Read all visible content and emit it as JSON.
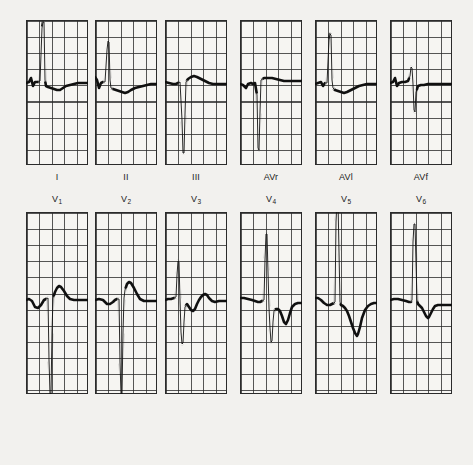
{
  "sheet": {
    "title": "12-lead electrocardiogram",
    "background_color": "#f2f1ee",
    "grid_color": "#2b2b2b",
    "trace_color": "#111111",
    "paper_speed": "25 mm/s",
    "calibration": "10 mm/mV"
  },
  "rows": [
    {
      "name": "limb-leads",
      "label_position": "below",
      "leads": [
        {
          "id": "I",
          "label": "I",
          "label_sub": ""
        },
        {
          "id": "II",
          "label": "II",
          "label_sub": ""
        },
        {
          "id": "III",
          "label": "III",
          "label_sub": ""
        },
        {
          "id": "AVR",
          "label": "AVr",
          "label_sub": ""
        },
        {
          "id": "AVL",
          "label": "AVl",
          "label_sub": ""
        },
        {
          "id": "AVF",
          "label": "AVf",
          "label_sub": ""
        }
      ]
    },
    {
      "name": "chest-leads",
      "label_position": "above",
      "leads": [
        {
          "id": "V1",
          "label": "V",
          "label_sub": "1"
        },
        {
          "id": "V2",
          "label": "V",
          "label_sub": "2"
        },
        {
          "id": "V3",
          "label": "V",
          "label_sub": "3"
        },
        {
          "id": "V4",
          "label": "V",
          "label_sub": "4"
        },
        {
          "id": "V5",
          "label": "V",
          "label_sub": "5"
        },
        {
          "id": "V6",
          "label": "V",
          "label_sub": "6"
        }
      ]
    }
  ],
  "chart_data": {
    "type": "line",
    "xlabel": "time",
    "ylabel": "voltage",
    "grid": true,
    "legend": "none",
    "panel_grid_columns": 5,
    "panel_grid_rows_limb": 9,
    "panel_grid_rows_chest": 11,
    "baseline_fraction_limb": 0.5,
    "baseline_fraction_chest": 0.5,
    "series": [
      {
        "name": "I",
        "baseline_y": 63,
        "points": "0,63 3,62 5,58 7,66 9,62 12,62 14,61 16,8 17,2 18,2 19,60 20,66 22,67 25,68 28,69 31,70 34,70 37,68 40,66 44,65 48,64 52,63 56,63 60,63 62,63"
      },
      {
        "name": "II",
        "baseline_y": 63,
        "points": "0,57 2,60 4,68 6,63 8,62 10,62 12,30 13,21 14,22 15,60 16,68 18,69 21,70 24,71 27,72 30,73 33,72 36,70 40,68 44,67 48,66 52,65 56,64 60,64 62,64"
      },
      {
        "name": "III",
        "baseline_y": 62,
        "points": "0,62 4,63 8,64 11,64 13,63 15,62 17,100 18,133 19,133 20,94 21,62 23,59 26,57 29,56 32,57 36,59 40,61 44,63 48,64 52,64 56,64 60,64 62,64"
      },
      {
        "name": "AVR",
        "baseline_y": 64,
        "points": "0,64 3,65 6,68 8,64 11,63 13,64 15,63 17,75 18,128 19,130 20,92 21,60 24,58 28,58 32,58 36,59 40,60 44,61 48,61 52,61 56,61 60,61 62,61"
      },
      {
        "name": "AVL",
        "baseline_y": 64,
        "points": "0,64 3,63 6,62 8,66 10,63 12,63 14,20 15,14 16,15 17,60 18,68 20,70 23,71 26,72 29,73 32,72 36,70 40,68 44,66 48,65 52,64 56,64 60,64 62,64"
      },
      {
        "name": "AVF",
        "baseline_y": 63,
        "points": "0,63 3,62 5,58 7,66 9,63 12,62 15,62 18,61 20,56 21,47 22,48 23,64 24,90 25,92 26,72 28,66 31,65 34,65 38,64 42,64 46,64 50,64 54,64 58,64 62,64"
      },
      {
        "name": "V1",
        "baseline_y": 88,
        "points": "0,88 3,87 6,89 9,95 12,96 15,93 18,88 20,87 22,86 23,148 24,182 25,182 26,120 27,86 29,80 31,76 33,74 35,75 38,79 41,84 44,87 48,88 52,88 56,88 60,88 62,88"
      },
      {
        "name": "V2",
        "baseline_y": 88,
        "points": "0,88 4,87 8,88 12,92 15,92 18,90 20,88 22,87 24,87 25,150 26,182 27,182 28,120 29,86 30,78 32,72 34,70 36,71 39,76 42,82 45,87 49,89 53,89 57,89 60,89 62,89"
      },
      {
        "name": "V3",
        "baseline_y": 88,
        "points": "0,88 3,87 6,87 9,86 11,85 12,63 13,49 14,50 15,88 16,120 17,132 18,131 19,110 20,95 22,92 24,95 26,98 28,99 30,97 32,92 34,88 36,85 38,83 40,82 42,83 44,86 47,89 50,90 54,89 58,89 62,89"
      },
      {
        "name": "V4",
        "baseline_y": 88,
        "points": "0,86 4,86 8,87 12,88 15,89 18,90 20,90 22,89 24,88 25,48 26,22 27,22 28,60 29,96 30,116 31,130 32,129 33,110 34,99 36,97 38,97 40,99 42,104 44,110 46,112 48,108 50,101 52,95 55,92 58,91 62,91"
      },
      {
        "name": "V5",
        "baseline_y": 88,
        "points": "0,86 3,86 6,88 9,91 12,93 15,93 17,92 19,91 20,90 21,10 22,-12 23,-12 24,40 25,90 26,93 28,94 30,96 32,99 34,104 36,110 38,116 40,121 42,124 43,122 45,115 47,106 50,98 53,94 56,92 59,91 62,91"
      },
      {
        "name": "V6",
        "baseline_y": 88,
        "points": "0,88 4,87 8,87 12,88 16,89 19,90 21,90 22,88 23,30 24,12 25,12 26,50 27,88 28,92 30,94 32,96 34,100 36,104 38,106 39,105 41,101 43,97 45,94 48,93 51,93 55,93 58,93 62,93"
      }
    ]
  }
}
